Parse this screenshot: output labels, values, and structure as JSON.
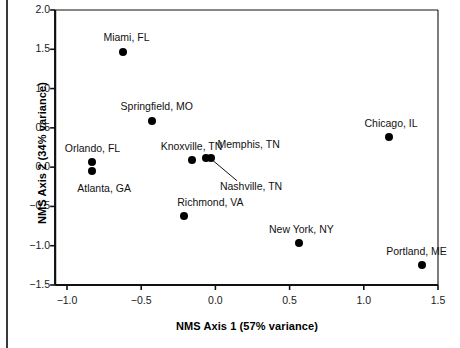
{
  "chart_data": {
    "type": "scatter",
    "title": "",
    "xlabel": "NMS Axis 1 (57% variance)",
    "ylabel": "NMS Axis 2 (34% variance)",
    "xlim": [
      -1.08,
      1.5
    ],
    "ylim": [
      -1.5,
      2.0
    ],
    "xticks": [
      -1.0,
      -0.5,
      0.0,
      0.5,
      1.0,
      1.5
    ],
    "xticklabels": [
      "−1.0",
      "−0.5",
      "0.0",
      "0.5",
      "1.0",
      "1.5"
    ],
    "yticks": [
      -1.5,
      -1.0,
      -0.5,
      0.0,
      0.5,
      1.0,
      1.5,
      2.0
    ],
    "yticklabels": [
      "−1.5",
      "−1.0",
      "−0.5",
      "0.0",
      "0.5",
      "1.0",
      "1.5",
      "2.0"
    ],
    "grid": false,
    "legend": "none",
    "marker_color": "#000000",
    "points": [
      {
        "label": "Miami, FL",
        "x": -0.62,
        "y": 1.47,
        "label_dx": 3,
        "label_dy": -15,
        "label_anchor": "middle",
        "leader": false
      },
      {
        "label": "Springfield, MO",
        "x": -0.43,
        "y": 0.59,
        "label_dx": 5,
        "label_dy": -15,
        "label_anchor": "middle",
        "leader": false
      },
      {
        "label": "Orlando, FL",
        "x": -0.83,
        "y": 0.07,
        "label_dx": 0,
        "label_dy": -14,
        "label_anchor": "middle",
        "leader": false
      },
      {
        "label": "Atlanta, GA",
        "x": -0.83,
        "y": -0.05,
        "label_dx": 12,
        "label_dy": 17,
        "label_anchor": "middle",
        "leader": false
      },
      {
        "label": "Knoxville, TN",
        "x": -0.16,
        "y": 0.09,
        "label_dx": 0,
        "label_dy": -14,
        "label_anchor": "middle",
        "leader": false
      },
      {
        "label": "Memphis, TN",
        "x": -0.06,
        "y": 0.12,
        "label_dx": 42,
        "label_dy": -14,
        "label_anchor": "middle",
        "leader": false
      },
      {
        "label": "Nashville, TN",
        "x": -0.03,
        "y": 0.12,
        "label_dx": 40,
        "label_dy": 28,
        "label_anchor": "middle",
        "leader": true
      },
      {
        "label": "Richmond, VA",
        "x": -0.21,
        "y": -0.62,
        "label_dx": 26,
        "label_dy": -14,
        "label_anchor": "middle",
        "leader": false
      },
      {
        "label": "New York, NY",
        "x": 0.56,
        "y": -0.96,
        "label_dx": 3,
        "label_dy": -14,
        "label_anchor": "middle",
        "leader": false
      },
      {
        "label": "Chicago, IL",
        "x": 1.17,
        "y": 0.39,
        "label_dx": 2,
        "label_dy": -14,
        "label_anchor": "middle",
        "leader": false
      },
      {
        "label": "Portland, ME",
        "x": 1.39,
        "y": -1.24,
        "label_dx": -5,
        "label_dy": -14,
        "label_anchor": "middle",
        "leader": false
      }
    ]
  },
  "axes": {
    "x_title": "NMS Axis 1 (57% variance)",
    "y_title": "NMS Axis 2 (34% variance)"
  }
}
